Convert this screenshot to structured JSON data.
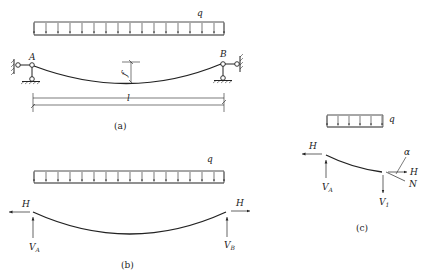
{
  "figure_a": {
    "load_label": "q",
    "support_left_label": "A",
    "support_right_label": "B",
    "sag_label": "f",
    "span_label": "l",
    "caption": "(a)"
  },
  "figure_b": {
    "load_label": "q",
    "left_h_label": "H",
    "right_h_label": "H",
    "left_v_label": "V",
    "left_v_sub": "A",
    "right_v_label": "V",
    "right_v_sub": "B",
    "caption": "(b)"
  },
  "figure_c": {
    "load_label": "q",
    "left_h_label": "H",
    "left_v_label": "V",
    "left_v_sub": "A",
    "right_h_label": "H",
    "tension_label": "N",
    "angle_label": "α",
    "right_v_label": "V",
    "right_v_sub": "1",
    "caption": "(c)"
  },
  "colors": {
    "line": "#222222",
    "background": "#ffffff"
  }
}
